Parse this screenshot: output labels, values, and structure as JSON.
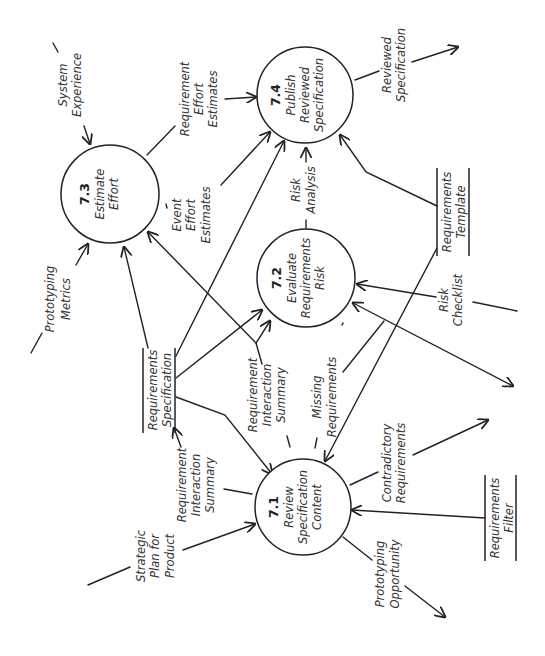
{
  "diagram": {
    "type": "data-flow-diagram",
    "orientation": "rotated-90-ccw",
    "colors": {
      "stroke": "#222222",
      "text": "#333333",
      "background": "#ffffff"
    },
    "processes": [
      {
        "id": "7.1",
        "number": "7.1",
        "lines": [
          "Review",
          "Specification",
          "Content"
        ],
        "cx": 303,
        "cy": 507,
        "r": 48
      },
      {
        "id": "7.2",
        "number": "7.2",
        "lines": [
          "Evaluate",
          "Requirements",
          "Risk"
        ],
        "cx": 306,
        "cy": 278,
        "r": 49
      },
      {
        "id": "7.3",
        "number": "7.3",
        "lines": [
          "Estimate",
          "Effort"
        ],
        "cx": 110,
        "cy": 194,
        "r": 49
      },
      {
        "id": "7.4",
        "number": "7.4",
        "lines": [
          "Publish",
          "Reviewed",
          "Specification"
        ],
        "cx": 305,
        "cy": 95,
        "r": 48
      }
    ],
    "data_stores": [
      {
        "id": "req-spec",
        "lines": [
          "Requirements",
          "Specification"
        ]
      },
      {
        "id": "req-template",
        "lines": [
          "Requirements",
          "Template"
        ]
      },
      {
        "id": "req-filter",
        "lines": [
          "Requirements",
          "Filter"
        ]
      }
    ],
    "flows": [
      {
        "id": "system-experience",
        "lines": [
          "System",
          "Experience"
        ],
        "to": "7.3"
      },
      {
        "id": "prototyping-metrics",
        "lines": [
          "Prototyping",
          "Metrics"
        ],
        "to": "7.3"
      },
      {
        "id": "requirement-effort-estimates",
        "lines": [
          "Requirement",
          "Effort",
          "Estimates"
        ],
        "from": "7.3",
        "to": "7.4"
      },
      {
        "id": "event-effort-estimates",
        "lines": [
          "Event",
          "Effort",
          "Estimates"
        ],
        "from": "7.3",
        "to": "7.4"
      },
      {
        "id": "reviewed-specification",
        "lines": [
          "Reviewed",
          "Specification"
        ],
        "from": "7.4"
      },
      {
        "id": "risk-analysis",
        "lines": [
          "Risk",
          "Analysis"
        ],
        "from": "7.2",
        "to": "7.4"
      },
      {
        "id": "risk-checklist",
        "lines": [
          "Risk",
          "Checklist"
        ],
        "to": "7.2"
      },
      {
        "id": "requirement-interaction-summary-a",
        "lines": [
          "Requirement",
          "Interaction",
          "Summary"
        ],
        "from": "7.1",
        "to": "7.2"
      },
      {
        "id": "missing-requirements",
        "lines": [
          "Missing",
          "Requirements"
        ],
        "from": "7.2",
        "to": "7.1"
      },
      {
        "id": "requirement-interaction-summary-b",
        "lines": [
          "Requirement",
          "Interaction",
          "Summary"
        ],
        "from": "7.1",
        "to": "req-spec"
      },
      {
        "id": "strategic-plan",
        "lines": [
          "Strategic",
          "Plan for",
          "Product"
        ],
        "to": "7.1"
      },
      {
        "id": "contradictory-requirements",
        "lines": [
          "Contradictory",
          "Requirements"
        ],
        "from": "7.1"
      },
      {
        "id": "prototyping-opportunity",
        "lines": [
          "Prototyping",
          "Opportunity"
        ],
        "from": "7.1"
      }
    ]
  }
}
